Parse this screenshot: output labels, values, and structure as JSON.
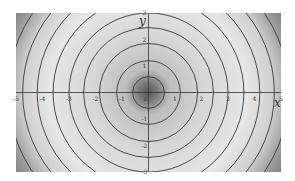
{
  "chart_data": {
    "type": "contour",
    "title": "",
    "xlabel": "x",
    "ylabel": "y",
    "xlim": [
      -5,
      5
    ],
    "ylim": [
      -3,
      3
    ],
    "x_ticks": [
      "-5",
      "-4",
      "-3",
      "-2",
      "-1",
      "0",
      "1",
      "2",
      "3",
      "4",
      "5"
    ],
    "y_ticks": [
      "-3",
      "-2",
      "-1",
      "1",
      "2",
      "3"
    ],
    "contour_radii": [
      0.6,
      1.2,
      1.85,
      2.45,
      3.0,
      3.6,
      4.2,
      4.75,
      5.3,
      5.9
    ],
    "grid": false,
    "legend": null,
    "colormap": "grayscale, dark at origin, lighter mid-range, darker toward corners"
  },
  "plot_box": {
    "left": 16,
    "top": 13,
    "right": 281,
    "bottom": 172
  },
  "colors": {
    "contour": "#3a3a3a",
    "axis": "#333333",
    "background": "#ffffff"
  }
}
